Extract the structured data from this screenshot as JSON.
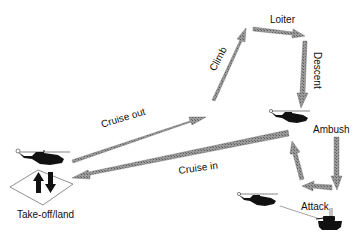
{
  "diagram": {
    "colors": {
      "arrow_fill": "#8a8a8a",
      "arrow_stroke": "#555555",
      "icon": "#111111",
      "background": "#ffffff"
    },
    "phases": [
      {
        "id": "takeoff",
        "label": "Take-off/land"
      },
      {
        "id": "cruise_out",
        "label": "Cruise out"
      },
      {
        "id": "climb",
        "label": "Climb"
      },
      {
        "id": "loiter",
        "label": "Loiter"
      },
      {
        "id": "descent",
        "label": "Descent"
      },
      {
        "id": "ambush",
        "label": "Ambush"
      },
      {
        "id": "attack",
        "label": "Attack"
      },
      {
        "id": "cruise_in",
        "label": "Cruise in"
      }
    ],
    "icons": [
      "helicopter-icon",
      "helicopter-icon",
      "helicopter-icon",
      "tank-icon",
      "takeoff-land-arrows-icon",
      "landing-pad-icon"
    ]
  }
}
